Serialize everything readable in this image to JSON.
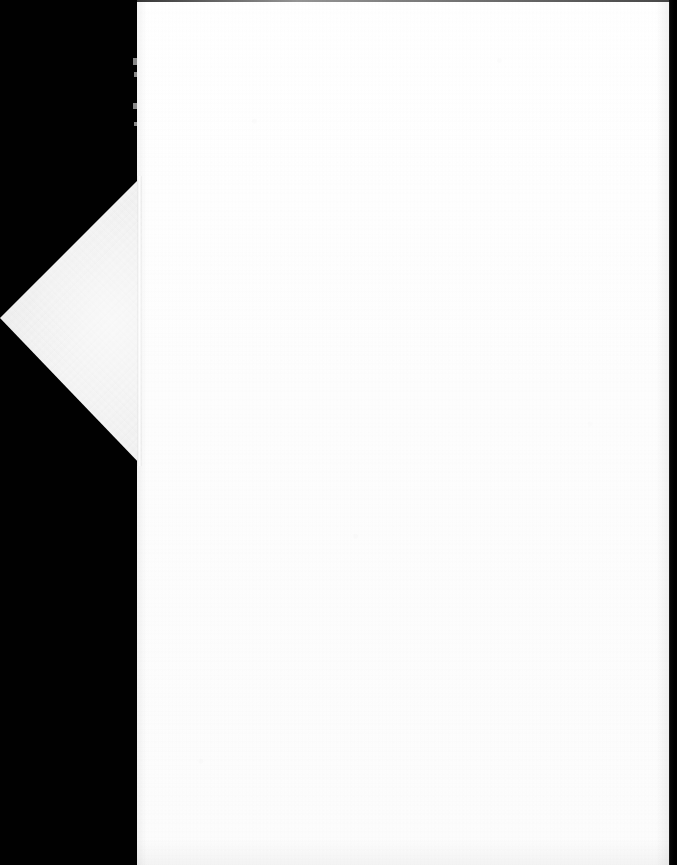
{
  "document": {
    "kind": "scanned-page-image",
    "page_content_text": "",
    "page_is_blank": true,
    "background_label": "scanner-black-backdrop",
    "page_label": "blank-scanned-page",
    "fold_label": "triangular-fold-out-flap"
  },
  "colors": {
    "backdrop": "#010101",
    "page": "#fefefe",
    "page_shadow": "#fcfcfc",
    "fold_flap": "#f3f3f3",
    "top_edge_line": "#141414",
    "right_strip": "#000000"
  },
  "geometry": {
    "canvas_width": 677,
    "canvas_height": 865,
    "page_left": 137,
    "page_right": 670,
    "page_top": 0,
    "page_bottom": 865,
    "fold_top_vertex": "137,178",
    "fold_apex": "0,318",
    "fold_bottom_vertex": "137,462",
    "right_strip_width": 8,
    "top_edge_line_height": 2
  },
  "annotations": {
    "page_description": "Blank white scanned sheet occupying the right portion of the frame",
    "fold_description": "Light gray triangular paper flap folded out to the left of the page edge",
    "edge_description": "Irregular notched left margin of the sheet"
  }
}
